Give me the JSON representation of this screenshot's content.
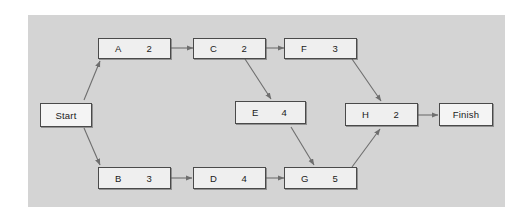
{
  "diagram": {
    "panel_color": "#d4d4d4",
    "node_fill": "#efefef",
    "node_border": "#4a4a4a",
    "arrow_color": "#6e6e6e",
    "start": {
      "label": "Start"
    },
    "finish": {
      "label": "Finish"
    },
    "activities": [
      {
        "id": "A",
        "duration": "2"
      },
      {
        "id": "B",
        "duration": "3"
      },
      {
        "id": "C",
        "duration": "2"
      },
      {
        "id": "D",
        "duration": "4"
      },
      {
        "id": "E",
        "duration": "4"
      },
      {
        "id": "F",
        "duration": "3"
      },
      {
        "id": "G",
        "duration": "5"
      },
      {
        "id": "H",
        "duration": "2"
      }
    ],
    "edges": [
      {
        "from": "Start",
        "to": "A"
      },
      {
        "from": "Start",
        "to": "B"
      },
      {
        "from": "A",
        "to": "C"
      },
      {
        "from": "C",
        "to": "F"
      },
      {
        "from": "C",
        "to": "E"
      },
      {
        "from": "F",
        "to": "H"
      },
      {
        "from": "E",
        "to": "G"
      },
      {
        "from": "B",
        "to": "D"
      },
      {
        "from": "D",
        "to": "G"
      },
      {
        "from": "G",
        "to": "H"
      },
      {
        "from": "H",
        "to": "Finish"
      }
    ]
  }
}
